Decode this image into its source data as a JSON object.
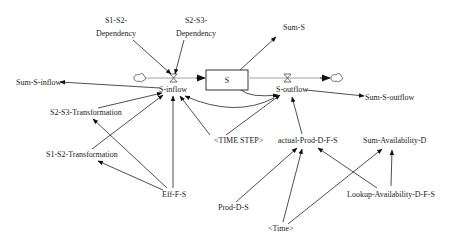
{
  "diagram": {
    "type": "stock-flow",
    "stock": {
      "id": "S",
      "label": "S"
    },
    "flows": {
      "inflow": {
        "id": "S-inflow",
        "label": "S-inflow"
      },
      "outflow": {
        "id": "S-outflow",
        "label": "S-outflow"
      }
    },
    "variables": {
      "s1s2dep": "S1-S2-\nDependency",
      "s1s2dep_l1": "S1-S2-",
      "s1s2dep_l2": "Dependency",
      "s2s3dep_l1": "S2-S3-",
      "s2s3dep_l2": "Dependency",
      "sum_s": "Sum-S",
      "sum_s_inflow": "Sum-S-inflow",
      "sum_s_outflow": "Sum-S-outflow",
      "s2s3trans": "S2-S3-Transformation",
      "s1s2trans": "S1-S2-Transformation",
      "eff_f_s": "Eff-F-S",
      "time_step": "<TIME STEP>",
      "actual_prod": "actual-Prod-D-F-S",
      "sum_avail": "Sum-Availability-D",
      "prod_d_s": "Prod-D-S",
      "lookup_avail": "Lookup-Availability-D-F-S",
      "time": "<Time>"
    },
    "links": [
      {
        "from": "S1-S2-Dependency",
        "to": "S-inflow"
      },
      {
        "from": "S2-S3-Dependency",
        "to": "S-inflow"
      },
      {
        "from": "S-inflow",
        "to": "Sum-S-inflow"
      },
      {
        "from": "S2-S3-Transformation",
        "to": "S-inflow"
      },
      {
        "from": "S1-S2-Transformation",
        "to": "S-inflow"
      },
      {
        "from": "Eff-F-S",
        "to": "S-inflow"
      },
      {
        "from": "Eff-F-S",
        "to": "S2-S3-Transformation"
      },
      {
        "from": "Eff-F-S",
        "to": "S1-S2-Transformation"
      },
      {
        "from": "<TIME STEP>",
        "to": "S-inflow"
      },
      {
        "from": "<TIME STEP>",
        "to": "S-outflow"
      },
      {
        "from": "S",
        "to": "Sum-S"
      },
      {
        "from": "S",
        "to": "S-outflow"
      },
      {
        "from": "S-outflow",
        "to": "S-inflow"
      },
      {
        "from": "S-outflow",
        "to": "Sum-S-outflow"
      },
      {
        "from": "actual-Prod-D-F-S",
        "to": "S-outflow"
      },
      {
        "from": "Prod-D-S",
        "to": "actual-Prod-D-F-S"
      },
      {
        "from": "<Time>",
        "to": "actual-Prod-D-F-S"
      },
      {
        "from": "<Time>",
        "to": "Sum-Availability-D"
      },
      {
        "from": "Lookup-Availability-D-F-S",
        "to": "actual-Prod-D-F-S"
      },
      {
        "from": "Lookup-Availability-D-F-S",
        "to": "Sum-Availability-D"
      }
    ]
  }
}
